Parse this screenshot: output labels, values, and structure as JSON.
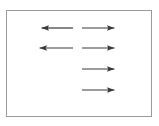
{
  "figure": {
    "name": "arrow-diagram",
    "background_color": "#ffffff",
    "frame": {
      "name": "outer-border-rectangle",
      "stroke_color": "#9a9a9a",
      "stroke_width": 1,
      "x": 6,
      "y": 10,
      "width": 146,
      "height": 107
    },
    "arrow_color": "#3a3a3a",
    "arrow_stroke_width": 1.2,
    "rows": 4,
    "columns": 2,
    "arrows": [
      {
        "id": "arrow-row1-left",
        "row": 1,
        "column": "left",
        "direction": "left",
        "x_start": 73,
        "x_end": 40,
        "y": 28,
        "length": 33
      },
      {
        "id": "arrow-row1-right",
        "row": 1,
        "column": "right",
        "direction": "right",
        "x_start": 82,
        "x_end": 116,
        "y": 28,
        "length": 34
      },
      {
        "id": "arrow-row2-left",
        "row": 2,
        "column": "left",
        "direction": "left",
        "x_start": 73,
        "x_end": 38,
        "y": 48,
        "length": 35
      },
      {
        "id": "arrow-row2-right",
        "row": 2,
        "column": "right",
        "direction": "right",
        "x_start": 82,
        "x_end": 116,
        "y": 48,
        "length": 34
      },
      {
        "id": "arrow-row3-right",
        "row": 3,
        "column": "right",
        "direction": "right",
        "x_start": 82,
        "x_end": 116,
        "y": 69,
        "length": 34
      },
      {
        "id": "arrow-row4-right",
        "row": 4,
        "column": "right",
        "direction": "right",
        "x_start": 82,
        "x_end": 116,
        "y": 90,
        "length": 34
      }
    ]
  }
}
